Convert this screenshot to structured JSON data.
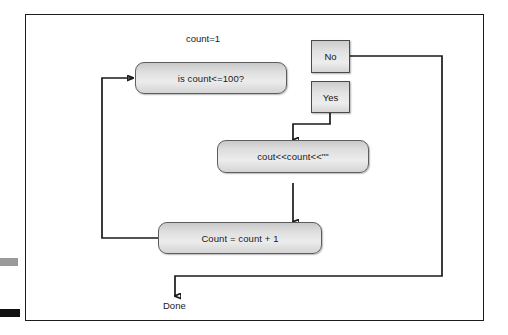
{
  "diagram": {
    "title_label": "count=1",
    "terminal_label": "Done",
    "nodes": [
      {
        "id": "condition",
        "label": "is count<=100?"
      },
      {
        "id": "print",
        "label": "cout<<count<<\"\""
      },
      {
        "id": "increment",
        "label": "Count = count + 1"
      }
    ],
    "branches": [
      {
        "id": "no",
        "label": "No"
      },
      {
        "id": "yes",
        "label": "Yes"
      }
    ],
    "edges": [
      {
        "id": "loop-back",
        "from": "increment",
        "to": "condition"
      },
      {
        "id": "yes-to-print",
        "from": "yes",
        "to": "print"
      },
      {
        "id": "print-to-increment",
        "from": "print",
        "to": "increment"
      },
      {
        "id": "no-to-done",
        "from": "no",
        "to": "Done"
      }
    ],
    "colors": {
      "node_fill_top": "#c9c9c9",
      "node_fill_bottom": "#d4d4d4",
      "node_border": "#5d5d5d",
      "connector": "#1a1a1a",
      "frame": "#1c1c1c",
      "edge_mark_gray": "#9a9a9a",
      "edge_mark_black": "#111111"
    }
  }
}
